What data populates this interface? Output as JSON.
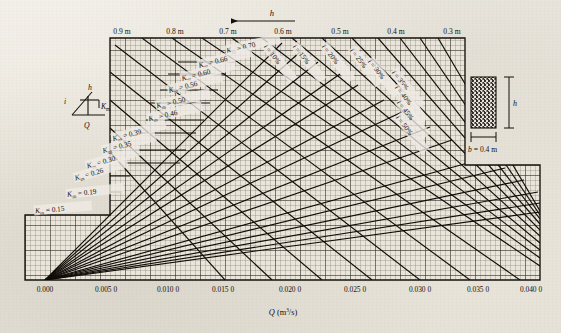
{
  "figure": {
    "type": "nomograph",
    "x_axis": {
      "title_symbol": "Q",
      "title_units": "(m3/s)",
      "title_units_display": "(m³/s)",
      "ticks": [
        "0.000",
        "0.005 0",
        "0.010 0",
        "0.015 0",
        "0.020 0",
        "0.025 0",
        "0.030 0",
        "0.035 0",
        "0.040 0"
      ],
      "tick_values": [
        0.0,
        0.005,
        0.01,
        0.015,
        0.02,
        0.025,
        0.03,
        0.035,
        0.04
      ],
      "min": 0.0,
      "max": 0.0425
    },
    "top_axis": {
      "arrow_label": "h",
      "arrow_direction": "left",
      "ticks": [
        "0.9 m",
        "0.8 m",
        "0.7 m",
        "0.6 m",
        "0.5 m",
        "0.4 m",
        "0.3 m"
      ],
      "tick_values": [
        0.9,
        0.8,
        0.7,
        0.6,
        0.5,
        0.4,
        0.3
      ]
    },
    "km_family": {
      "symbol": "K",
      "subscript": "m",
      "labels": [
        "K_m = 0.70",
        "K_m = 0.66",
        "K_m = 0.60",
        "K_m = 0.56",
        "K_m = 0.50",
        "K_m = 0.46",
        "K_m = 0.39",
        "K_m = 0.35",
        "K_m = 0.30",
        "K_m = 0.26",
        "K_m = 0.19",
        "K_m = 0.15"
      ],
      "values": [
        0.7,
        0.66,
        0.6,
        0.56,
        0.5,
        0.46,
        0.39,
        0.35,
        0.3,
        0.26,
        0.19,
        0.15
      ]
    },
    "i_family": {
      "symbol": "i",
      "labels": [
        "i = 10%",
        "i = 15%",
        "i = 20%",
        "i = 25%",
        "i = 30%",
        "i = 35%",
        "i = 40%",
        "i = 45%",
        "i = 50%"
      ],
      "values": [
        10,
        15,
        20,
        25,
        30,
        35,
        40,
        45,
        50
      ]
    },
    "inset_left": {
      "slope_symbol": "i",
      "depth_symbol": "h",
      "roughness_symbol": "K",
      "roughness_subscript": "m",
      "flow_symbol": "Q"
    },
    "inset_right": {
      "height_symbol": "h",
      "width_label": "b = 0.4 m",
      "width_value": 0.4
    },
    "colors": {
      "paper": "#efece5",
      "ink": "#14110c",
      "grid_minor": "#6f6a5e",
      "grid_major": "#2b2620",
      "curve": "#100d08"
    }
  },
  "chart_data": {
    "type": "line",
    "title": "",
    "xlabel": "Q (m³/s)",
    "ylabel": "",
    "xlim": [
      0.0,
      0.0425
    ],
    "grid": true,
    "legend": "inline-annotations",
    "x_ticks": [
      0.0,
      0.005,
      0.01,
      0.015,
      0.02,
      0.025,
      0.03,
      0.035,
      0.04
    ],
    "x_tick_labels": [
      "0.000",
      "0.005 0",
      "0.010 0",
      "0.015 0",
      "0.020 0",
      "0.025 0",
      "0.030 0",
      "0.035 0",
      "0.040 0"
    ],
    "top_axis_ticks": [
      0.9,
      0.8,
      0.7,
      0.6,
      0.5,
      0.4,
      0.3
    ],
    "top_axis_tick_labels": [
      "0.9 m",
      "0.8 m",
      "0.7 m",
      "0.6 m",
      "0.5 m",
      "0.4 m",
      "0.3 m"
    ],
    "series": [
      {
        "name": "K_m = 0.70",
        "group": "Km",
        "value": 0.7
      },
      {
        "name": "K_m = 0.66",
        "group": "Km",
        "value": 0.66
      },
      {
        "name": "K_m = 0.60",
        "group": "Km",
        "value": 0.6
      },
      {
        "name": "K_m = 0.56",
        "group": "Km",
        "value": 0.56
      },
      {
        "name": "K_m = 0.50",
        "group": "Km",
        "value": 0.5
      },
      {
        "name": "K_m = 0.46",
        "group": "Km",
        "value": 0.46
      },
      {
        "name": "K_m = 0.39",
        "group": "Km",
        "value": 0.39
      },
      {
        "name": "K_m = 0.35",
        "group": "Km",
        "value": 0.35
      },
      {
        "name": "K_m = 0.30",
        "group": "Km",
        "value": 0.3
      },
      {
        "name": "K_m = 0.26",
        "group": "Km",
        "value": 0.26
      },
      {
        "name": "K_m = 0.19",
        "group": "Km",
        "value": 0.19
      },
      {
        "name": "K_m = 0.15",
        "group": "Km",
        "value": 0.15
      },
      {
        "name": "i = 10%",
        "group": "i",
        "value": 10
      },
      {
        "name": "i = 15%",
        "group": "i",
        "value": 15
      },
      {
        "name": "i = 20%",
        "group": "i",
        "value": 20
      },
      {
        "name": "i = 25%",
        "group": "i",
        "value": 25
      },
      {
        "name": "i = 30%",
        "group": "i",
        "value": 30
      },
      {
        "name": "i = 35%",
        "group": "i",
        "value": 35
      },
      {
        "name": "i = 40%",
        "group": "i",
        "value": 40
      },
      {
        "name": "i = 45%",
        "group": "i",
        "value": 45
      },
      {
        "name": "i = 50%",
        "group": "i",
        "value": 50
      }
    ],
    "annotations": [
      "h",
      "b = 0.4 m",
      "Q",
      "i",
      "K_m"
    ]
  }
}
